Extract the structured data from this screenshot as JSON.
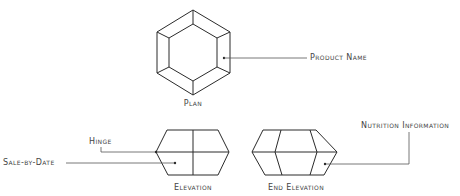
{
  "diagram": {
    "type": "technical-drawing",
    "colors": {
      "stroke": "#2a2a2a",
      "leader": "#555555",
      "text": "#444444",
      "background": "#ffffff"
    },
    "views": {
      "plan": {
        "label": "Plan"
      },
      "elevation": {
        "label": "Elevation"
      },
      "end_elevation": {
        "label": "End Elevation"
      }
    },
    "callouts": {
      "product_name": {
        "label": "Product Name",
        "target_view": "plan"
      },
      "hinge": {
        "label": "Hinge",
        "target_view": "elevation"
      },
      "sale_by_date": {
        "label": "Sale-by-Date",
        "target_view": "elevation"
      },
      "nutrition_information": {
        "label": "Nutrition Information",
        "target_view": "end_elevation"
      }
    }
  }
}
